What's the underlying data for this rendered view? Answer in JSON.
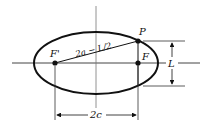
{
  "diagram": {
    "type": "ellipse-latus-rectum",
    "labels": {
      "focus_left": "F'",
      "focus_right": "F",
      "point": "P",
      "focal_segment": "2a − L/2",
      "latus_height": "L",
      "focal_distance": "2c"
    },
    "colors": {
      "stroke": "#111111",
      "axis": "#444444",
      "background": "#ffffff"
    }
  }
}
